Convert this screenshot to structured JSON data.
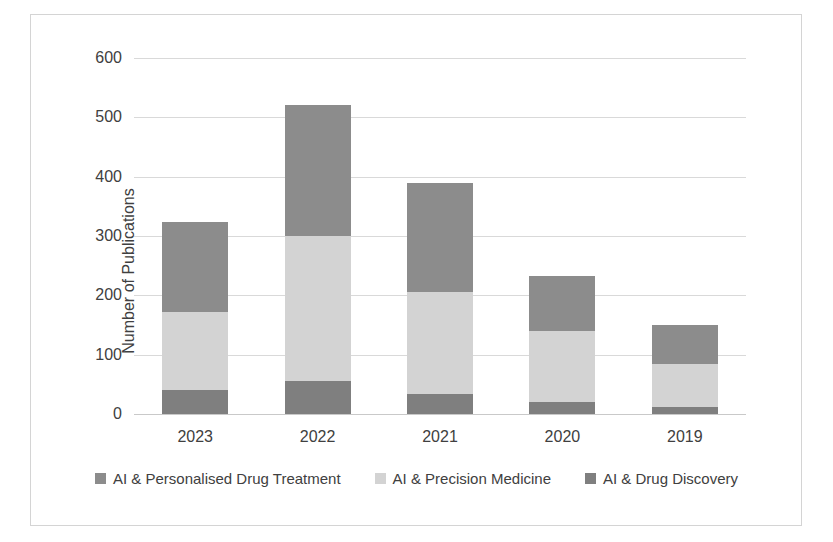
{
  "chart_data": {
    "type": "bar",
    "subtype": "stacked-bar-vertical",
    "title": "",
    "subtitle": "",
    "xlabel": "",
    "ylabel": "Number of Publications",
    "categories": [
      "2023",
      "2022",
      "2021",
      "2020",
      "2019"
    ],
    "series": [
      {
        "name": "AI & Drug Discovery",
        "values": [
          40,
          55,
          33,
          20,
          12
        ],
        "color": "#7f7f7f"
      },
      {
        "name": "AI & Precision Medicine",
        "values": [
          132,
          245,
          172,
          120,
          73
        ],
        "color": "#d3d3d3"
      },
      {
        "name": "AI & Personalised Drug Treatment",
        "values": [
          151,
          220,
          185,
          92,
          65
        ],
        "color": "#8c8c8c"
      }
    ],
    "stack_order_bottom_to_top": [
      "AI & Drug Discovery",
      "AI & Precision Medicine",
      "AI & Personalised Drug Treatment"
    ],
    "stack_totals": [
      323,
      520,
      390,
      232,
      150
    ],
    "stack_boundaries": {
      "2023": [
        0,
        40,
        172,
        323
      ],
      "2022": [
        0,
        55,
        300,
        520
      ],
      "2021": [
        0,
        33,
        205,
        390
      ],
      "2020": [
        0,
        20,
        140,
        232
      ],
      "2019": [
        0,
        12,
        85,
        150
      ]
    },
    "ylim": [
      0,
      600
    ],
    "yticks": [
      0,
      100,
      200,
      300,
      400,
      500,
      600
    ],
    "ytick_labels": [
      "0",
      "100",
      "200",
      "300",
      "400",
      "500",
      "600"
    ],
    "grid": true,
    "grid_axis": "y",
    "legend_position": "bottom",
    "legend_entries": [
      {
        "label": "AI & Personalised Drug Treatment",
        "color": "#8c8c8c"
      },
      {
        "label": "AI & Precision Medicine",
        "color": "#d3d3d3"
      },
      {
        "label": "AI & Drug Discovery",
        "color": "#7f7f7f"
      }
    ]
  },
  "axis": {
    "y_title": "Number of Publications",
    "y_labels": [
      "600",
      "500",
      "400",
      "300",
      "200",
      "100",
      "0"
    ],
    "x_labels": [
      "2023",
      "2022",
      "2021",
      "2020",
      "2019"
    ]
  },
  "legend": {
    "items": [
      {
        "label": "AI & Personalised Drug Treatment"
      },
      {
        "label": "AI & Precision Medicine"
      },
      {
        "label": "AI & Drug Discovery"
      }
    ]
  },
  "colors": {
    "series_personalised": "#8c8c8c",
    "series_precision": "#d3d3d3",
    "series_discovery": "#7f7f7f",
    "gridline": "#d9d9d9",
    "frame": "#d4d4d4",
    "text": "#404040"
  }
}
